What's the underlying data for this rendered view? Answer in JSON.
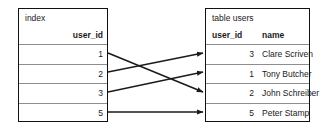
{
  "diagram": {
    "type": "index-to-table-mapping",
    "index_table": {
      "caption": "index",
      "columns": [
        "user_id"
      ],
      "rows": [
        {
          "user_id": "1"
        },
        {
          "user_id": "2"
        },
        {
          "user_id": "3"
        },
        {
          "user_id": "5"
        }
      ]
    },
    "users_table": {
      "caption": "table users",
      "columns": [
        "user_id",
        "name"
      ],
      "rows": [
        {
          "user_id": "3",
          "name": "Clare Scriven"
        },
        {
          "user_id": "1",
          "name": "Tony Butcher"
        },
        {
          "user_id": "2",
          "name": "John Schreiber"
        },
        {
          "user_id": "5",
          "name": "Peter Stamp"
        }
      ]
    },
    "connectors": [
      {
        "name": "arrow-index-1-to-users-row-3",
        "from_index_row": 0,
        "to_users_row": 2,
        "from_value": "1",
        "to_value": "2"
      },
      {
        "name": "arrow-index-2-to-users-row-1",
        "from_index_row": 1,
        "to_users_row": 0,
        "from_value": "2",
        "to_value": "3"
      },
      {
        "name": "arrow-index-3-to-users-row-2",
        "from_index_row": 2,
        "to_users_row": 1,
        "from_value": "3",
        "to_value": "1"
      },
      {
        "name": "arrow-index-5-to-users-row-4",
        "from_index_row": 3,
        "to_users_row": 3,
        "from_value": "5",
        "to_value": "5"
      }
    ],
    "colors": {
      "border": "#111111",
      "row_divider": "#8e8e8e",
      "arrow": "#1a1a1a",
      "background": "#ffffff",
      "text": "#1a1a1a"
    }
  }
}
